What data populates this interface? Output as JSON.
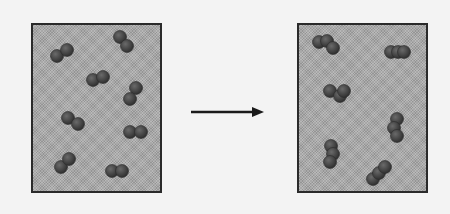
{
  "diagram": {
    "colors": {
      "background": "#f3f3f3",
      "box_fill": "#a9a9a9",
      "box_border": "#2a2a2a",
      "atom": "#4a4a4a",
      "atom_highlight": "#6a6a6a",
      "arrow": "#1a1a1a"
    },
    "left_box": {
      "label": "reactants",
      "x": 31,
      "y": 23,
      "w": 131,
      "h": 170,
      "molecules": [
        {
          "atoms": [
            [
              57,
              56
            ],
            [
              67,
              50
            ]
          ]
        },
        {
          "atoms": [
            [
              120,
              37
            ],
            [
              127,
              46
            ]
          ]
        },
        {
          "atoms": [
            [
              93,
              80
            ],
            [
              103,
              77
            ]
          ]
        },
        {
          "atoms": [
            [
              136,
              88
            ],
            [
              130,
              99
            ]
          ]
        },
        {
          "atoms": [
            [
              68,
              118
            ],
            [
              78,
              124
            ]
          ]
        },
        {
          "atoms": [
            [
              130,
              132
            ],
            [
              141,
              132
            ]
          ]
        },
        {
          "atoms": [
            [
              61,
              167
            ],
            [
              69,
              159
            ]
          ]
        },
        {
          "atoms": [
            [
              112,
              171
            ],
            [
              122,
              171
            ]
          ]
        }
      ]
    },
    "arrow": {
      "x1": 191,
      "y1": 112,
      "x2": 264,
      "y2": 112
    },
    "right_box": {
      "label": "products",
      "x": 297,
      "y": 23,
      "w": 131,
      "h": 170,
      "molecules": [
        {
          "atoms": [
            [
              319,
              42
            ],
            [
              327,
              41
            ],
            [
              333,
              48
            ]
          ]
        },
        {
          "atoms": [
            [
              391,
              52
            ],
            [
              398,
              52
            ],
            [
              404,
              52
            ]
          ]
        },
        {
          "atoms": [
            [
              330,
              91
            ],
            [
              340,
              96
            ],
            [
              344,
              91
            ]
          ]
        },
        {
          "atoms": [
            [
              397,
              119
            ],
            [
              394,
              128
            ],
            [
              397,
              136
            ]
          ]
        },
        {
          "atoms": [
            [
              331,
              146
            ],
            [
              333,
              154
            ],
            [
              330,
              162
            ]
          ]
        },
        {
          "atoms": [
            [
              373,
              179
            ],
            [
              379,
              173
            ],
            [
              385,
              167
            ]
          ]
        }
      ]
    }
  }
}
